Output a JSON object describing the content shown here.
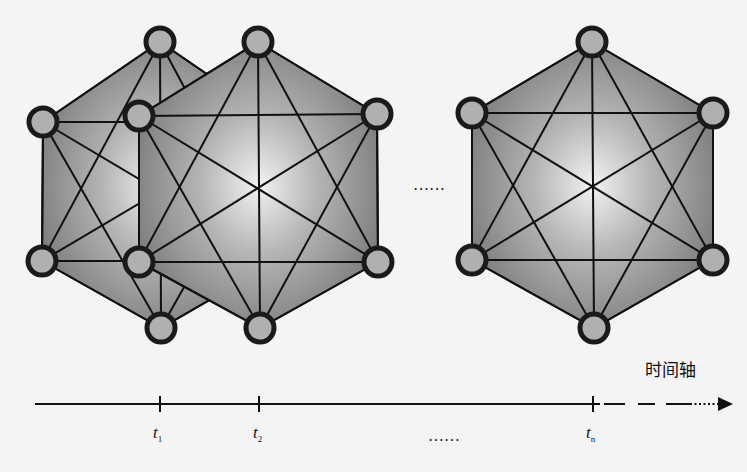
{
  "figure": {
    "background": "#f4f4f4",
    "fill_color": "#8a8a8a",
    "center_highlight": "#f4f4f4",
    "edge_color": "#111111",
    "node_fill": "#b0b0b0",
    "node_stroke": "#1a1a1a"
  },
  "snapshots": [
    {
      "label": "t1",
      "center": [
        160,
        185
      ],
      "nodes": [
        [
          160,
          42
        ],
        [
          43,
          122
        ],
        [
          277,
          122
        ],
        [
          42,
          261
        ],
        [
          277,
          261
        ],
        [
          161,
          328
        ]
      ]
    },
    {
      "label": "t2",
      "center": [
        258,
        189
      ],
      "nodes": [
        [
          258,
          42
        ],
        [
          139,
          116
        ],
        [
          377,
          114
        ],
        [
          139,
          262
        ],
        [
          378,
          262
        ],
        [
          260,
          328
        ]
      ]
    },
    {
      "label": "tn",
      "center": [
        592,
        188
      ],
      "nodes": [
        [
          592,
          42
        ],
        [
          472,
          113
        ],
        [
          713,
          113
        ],
        [
          472,
          260
        ],
        [
          713,
          260
        ],
        [
          594,
          328
        ]
      ]
    }
  ],
  "ellipsis_between_snapshots": "……",
  "axis": {
    "title": "时间轴",
    "ticks": [
      {
        "name": "t",
        "sub": "1",
        "x": 160
      },
      {
        "name": "t",
        "sub": "2",
        "x": 259
      },
      {
        "name": "t",
        "sub": "n",
        "x": 593
      }
    ],
    "ellipsis": "……"
  }
}
